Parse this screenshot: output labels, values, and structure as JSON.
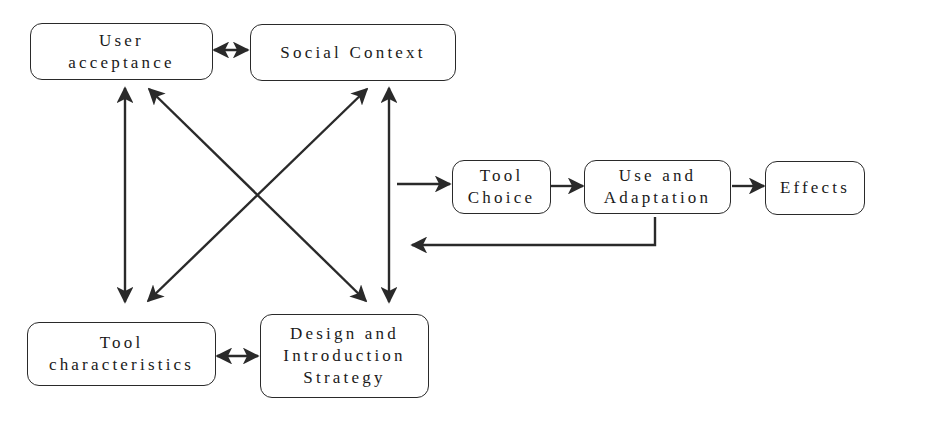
{
  "diagram": {
    "nodes": {
      "user_acceptance": {
        "lines": [
          "User",
          "acceptance"
        ]
      },
      "social_context": {
        "lines": [
          "Social Context"
        ]
      },
      "tool_characteristics": {
        "lines": [
          "Tool",
          "characteristics"
        ]
      },
      "design_strategy": {
        "lines": [
          "Design and",
          "Introduction",
          "Strategy"
        ]
      },
      "tool_choice": {
        "lines": [
          "Tool",
          "Choice"
        ]
      },
      "use_adaptation": {
        "lines": [
          "Use and",
          "Adaptation"
        ]
      },
      "effects": {
        "lines": [
          "Effects"
        ]
      }
    },
    "edges": [
      {
        "from": "User acceptance",
        "to": "Social Context",
        "type": "bidirectional"
      },
      {
        "from": "Tool characteristics",
        "to": "Design and Introduction Strategy",
        "type": "bidirectional"
      },
      {
        "from": "User acceptance",
        "to": "Tool characteristics",
        "type": "bidirectional"
      },
      {
        "from": "Social Context",
        "to": "Design and Introduction Strategy",
        "type": "bidirectional"
      },
      {
        "from": "User acceptance",
        "to": "Design and Introduction Strategy",
        "type": "bidirectional"
      },
      {
        "from": "Social Context",
        "to": "Tool characteristics",
        "type": "bidirectional"
      },
      {
        "from": "Context cluster",
        "to": "Tool Choice",
        "type": "directed"
      },
      {
        "from": "Tool Choice",
        "to": "Use and Adaptation",
        "type": "directed"
      },
      {
        "from": "Use and Adaptation",
        "to": "Effects",
        "type": "directed"
      },
      {
        "from": "Use and Adaptation",
        "to": "Context cluster",
        "type": "feedback"
      }
    ],
    "colors": {
      "stroke": "#2a2a2a",
      "background": "#ffffff"
    }
  }
}
